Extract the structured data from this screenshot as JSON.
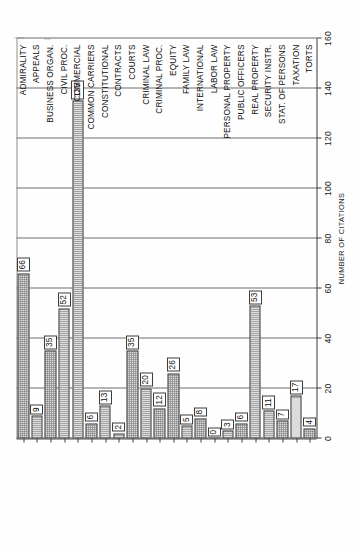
{
  "chart_data": {
    "type": "bar",
    "orientation": "horizontal",
    "title": "",
    "xlabel": "NUMBER OF CITATIONS",
    "ylabel": "",
    "xlim": [
      0,
      160
    ],
    "xticks": [
      0,
      20,
      40,
      60,
      80,
      100,
      120,
      140,
      160
    ],
    "grid": true,
    "legend": "none",
    "categories": [
      "ADMIRALITY",
      "APPEALS",
      "BUSINESS ORGAN.",
      "CIVIL PROC.",
      "COMMERCIAL",
      "COMMON CARRIERS",
      "CONSTITUTIONAL",
      "CONTRACTS",
      "COURTS",
      "CRIMINAL LAW",
      "CRIMINAL PROC.",
      "EQUITY",
      "FAMILY LAW",
      "INTERNATIONAL",
      "LABOR LAW",
      "PERSONAL PROPERTY",
      "PUBLIC OFFICERS",
      "REAL PROPERTY",
      "SECURITY INSTR.",
      "STAT. OF PERSONS",
      "TAXATION",
      "TORTS"
    ],
    "values": [
      66,
      9,
      35,
      52,
      135,
      6,
      13,
      2,
      35,
      20,
      12,
      26,
      5,
      8,
      0,
      3,
      6,
      53,
      11,
      7,
      17,
      4
    ],
    "value_labels": [
      "66",
      "9",
      "35",
      "52",
      "135",
      "6",
      "13",
      "2",
      "35",
      "20",
      "12",
      "26",
      "5",
      "8",
      "0",
      "3",
      "6",
      "53",
      "11",
      "7",
      "17",
      "4"
    ],
    "tick_labels": [
      "0",
      "20",
      "40",
      "60",
      "80",
      "100",
      "120",
      "140",
      "160"
    ]
  },
  "colors": {
    "bar_fill": "#dcdcdc",
    "bar_stroke": "#3d3d3d",
    "grid": "#6d6d6d",
    "axis": "#3a3a3a",
    "text": "#111111",
    "page": "#ffffff"
  }
}
